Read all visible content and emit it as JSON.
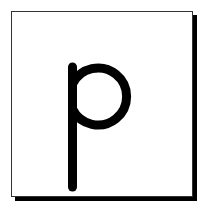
{
  "card": {
    "letter": "p",
    "letter_color": "#000000",
    "background_color": "#ffffff",
    "border_color": "#333333",
    "shadow_color": "#000000"
  }
}
